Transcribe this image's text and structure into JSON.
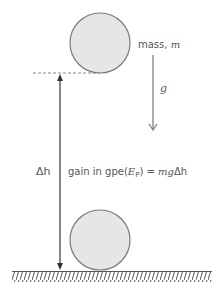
{
  "diagram": {
    "labels": {
      "mass_text": "mass, ",
      "mass_symbol": "m",
      "gravity_symbol": "g",
      "delta_h": "Δh",
      "gain_prefix": "gain in gpe(",
      "ep_symbol": "E",
      "ep_subscript": "P",
      "gain_suffix": ") = ",
      "formula_mg": "mg",
      "formula_dh": "Δh"
    },
    "elements": {
      "top_ball": "ball raised",
      "bottom_ball": "ball on ground",
      "ground": "hatched ground",
      "height_arrow": "height difference arrow",
      "gravity_arrow": "gravity arrow"
    },
    "colors": {
      "ball_fill": "#e6e6e6",
      "ball_stroke": "#7a7a7a",
      "arrow": "#333333",
      "gravity_arrow": "#777777",
      "dashed": "#888888",
      "ground": "#555555"
    }
  }
}
